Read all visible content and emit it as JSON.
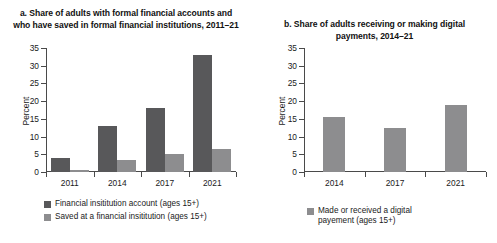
{
  "chart_data": [
    {
      "type": "bar",
      "panel": "a",
      "title": "a. Share of adults with formal financial accounts and who have saved in formal financial institutions, 2011–21",
      "xlabel": "",
      "ylabel": "Percent",
      "ylim": [
        0,
        35
      ],
      "yticks": [
        0,
        5,
        10,
        15,
        20,
        25,
        30,
        35
      ],
      "grid": false,
      "legend_position": "bottom-left",
      "categories": [
        "2011",
        "2014",
        "2017",
        "2021"
      ],
      "series": [
        {
          "name": "Financial insititution account (ages 15+)",
          "color": "#58585a",
          "values": [
            4,
            13,
            18,
            33
          ]
        },
        {
          "name": "Saved at a financial insititution (ages 15+)",
          "color": "#8d8d8f",
          "values": [
            0.5,
            3.5,
            5,
            6.5
          ]
        }
      ]
    },
    {
      "type": "bar",
      "panel": "b",
      "title": "b. Share of adults receiving or making digital payments, 2014–21",
      "xlabel": "",
      "ylabel": "Percent",
      "ylim": [
        0,
        35
      ],
      "yticks": [
        0,
        5,
        10,
        15,
        20,
        25,
        30,
        35
      ],
      "grid": false,
      "legend_position": "bottom-center",
      "categories": [
        "2014",
        "2017",
        "2021"
      ],
      "series": [
        {
          "name": "Made or received a digital payement (ages 15+)",
          "color": "#8d8d8f",
          "values": [
            15.5,
            12.5,
            19
          ]
        }
      ]
    }
  ],
  "panel_a": {
    "title": "a. Share of adults with formal financial accounts and who have saved in formal financial institutions, 2011–21",
    "ylabel": "Percent",
    "yticks": [
      "35",
      "30",
      "25",
      "20",
      "15",
      "10",
      "5",
      "0"
    ],
    "xlabels": [
      "2011",
      "2014",
      "2017",
      "2021"
    ],
    "legend": [
      {
        "label": "Financial insititution account (ages 15+)",
        "color": "#58585a"
      },
      {
        "label": "Saved at a financial insititution (ages 15+)",
        "color": "#8d8d8f"
      }
    ]
  },
  "panel_b": {
    "title": "b. Share of adults receiving or making digital payments, 2014–21",
    "ylabel": "Percent",
    "yticks": [
      "35",
      "30",
      "25",
      "20",
      "15",
      "10",
      "5",
      "0"
    ],
    "xlabels": [
      "2014",
      "2017",
      "2021"
    ],
    "legend": [
      {
        "label": "Made or received a digital payement (ages 15+)",
        "color": "#8d8d8f"
      }
    ]
  }
}
